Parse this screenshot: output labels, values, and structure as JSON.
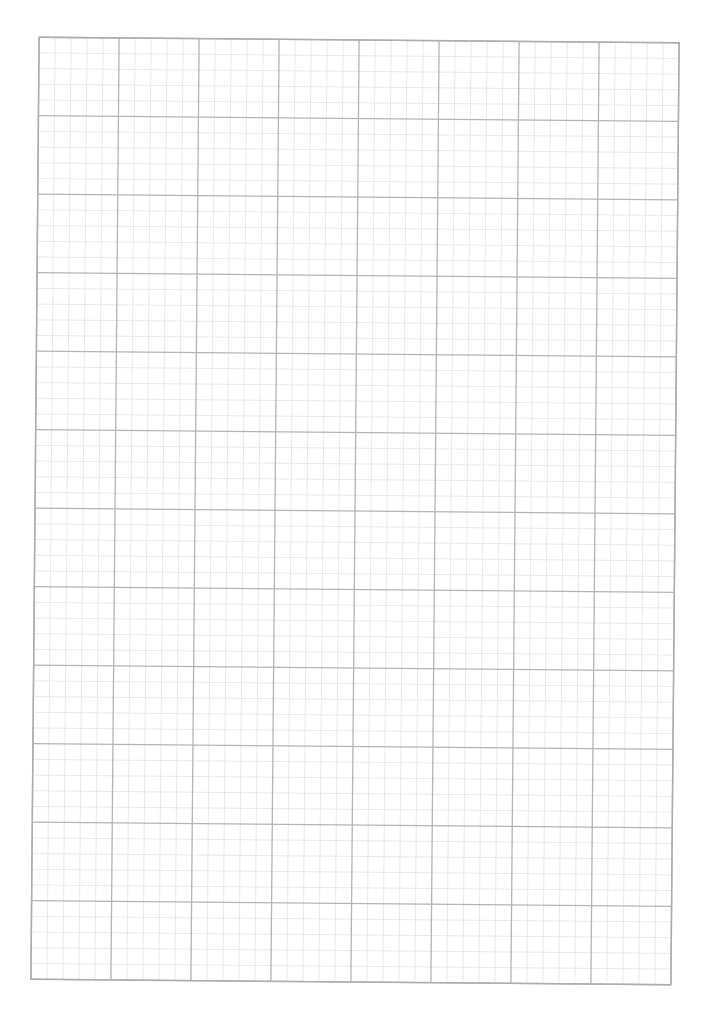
{
  "page": {
    "width": 705,
    "height": 1019,
    "background": "#ffffff"
  },
  "graph_paper": {
    "columns": 8,
    "rows": 12,
    "subdivisions": 5,
    "origin": {
      "x": 35,
      "y": 40
    },
    "cell_width": 80,
    "cell_height": 78.5,
    "rotation_deg": 0.5,
    "major_line_color": "#b4b4b4",
    "minor_line_color": "#e3e3e3",
    "border_color": "#adadad",
    "major_line_width": 1.3,
    "minor_line_width": 0.8
  }
}
